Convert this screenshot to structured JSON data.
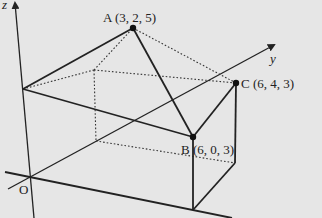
{
  "diagram": {
    "type": "3d-coordinate-solid",
    "axes": {
      "z_label": "z",
      "y_label": "y",
      "origin_label": "O"
    },
    "points": {
      "A": {
        "label": "A (3, 2, 5)"
      },
      "B": {
        "label": "B (6, 0, 3)"
      },
      "C": {
        "label": "C (6, 4, 3)"
      }
    },
    "colors": {
      "background": "#e6e6e6",
      "line": "#222222"
    }
  }
}
